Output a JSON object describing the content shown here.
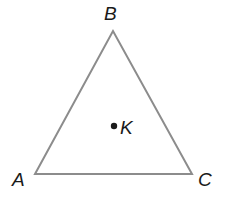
{
  "diagram": {
    "type": "triangle",
    "stroke_color": "#8c8c8c",
    "dot_color": "#1a1a1a",
    "vertices": {
      "A": {
        "label": "A",
        "x": 35,
        "y": 174
      },
      "B": {
        "label": "B",
        "x": 113,
        "y": 31
      },
      "C": {
        "label": "C",
        "x": 192,
        "y": 174
      }
    },
    "interior_point": {
      "label": "K",
      "x": 114,
      "y": 126
    }
  }
}
